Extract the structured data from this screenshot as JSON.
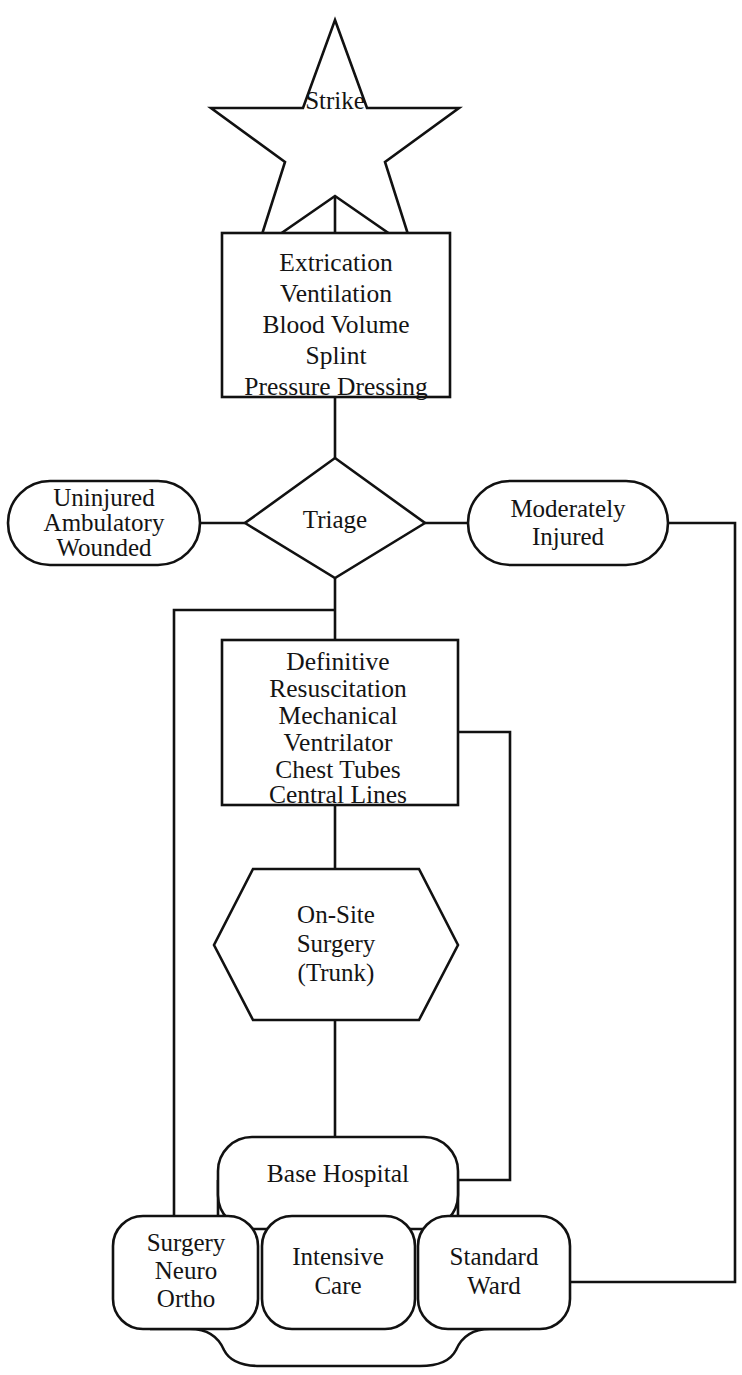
{
  "diagram": {
    "type": "flowchart",
    "background_color": "#ffffff",
    "line_color": "#111111",
    "text_color": "#141414",
    "nodes": {
      "strike": {
        "shape": "star",
        "label": "Strike"
      },
      "field_care": {
        "shape": "rectangle",
        "lines": [
          "Extrication",
          "Ventilation",
          "Blood Volume",
          "Splint",
          "Pressure Dressing"
        ]
      },
      "triage": {
        "shape": "diamond",
        "label": "Triage"
      },
      "uninjured": {
        "shape": "stadium",
        "lines": [
          "Uninjured",
          "Ambulatory",
          "Wounded"
        ]
      },
      "moderately_injured": {
        "shape": "stadium",
        "lines": [
          "Moderately",
          "Injured"
        ]
      },
      "definitive": {
        "shape": "rectangle",
        "lines": [
          "Definitive",
          "Resuscitation",
          "Mechanical",
          "Ventrilator",
          "Chest Tubes",
          "Central Lines"
        ]
      },
      "on_site_surgery": {
        "shape": "hexagon",
        "lines": [
          "On-Site",
          "Surgery",
          "(Trunk)"
        ]
      },
      "base_hospital": {
        "shape": "rounded-rectangle",
        "label": "Base Hospital"
      },
      "surgery_unit": {
        "shape": "rounded-rectangle",
        "lines": [
          "Surgery",
          "Neuro",
          "Ortho"
        ]
      },
      "intensive_care": {
        "shape": "rounded-rectangle",
        "lines": [
          "Intensive",
          "Care"
        ]
      },
      "standard_ward": {
        "shape": "rounded-rectangle",
        "lines": [
          "Standard",
          "Ward"
        ]
      }
    },
    "edges": [
      {
        "from": "strike",
        "to": "field_care"
      },
      {
        "from": "field_care",
        "to": "triage"
      },
      {
        "from": "triage",
        "to": "uninjured"
      },
      {
        "from": "triage",
        "to": "moderately_injured"
      },
      {
        "from": "triage",
        "to": "definitive"
      },
      {
        "from": "triage",
        "to": "surgery_unit"
      },
      {
        "from": "definitive",
        "to": "on_site_surgery"
      },
      {
        "from": "definitive",
        "to": "base_hospital"
      },
      {
        "from": "on_site_surgery",
        "to": "base_hospital"
      },
      {
        "from": "base_hospital",
        "to": "surgery_unit"
      },
      {
        "from": "base_hospital",
        "to": "intensive_care"
      },
      {
        "from": "base_hospital",
        "to": "standard_ward"
      },
      {
        "from": "moderately_injured",
        "to": "standard_ward"
      },
      {
        "from": "surgery_unit",
        "to": "standard_ward"
      }
    ]
  }
}
